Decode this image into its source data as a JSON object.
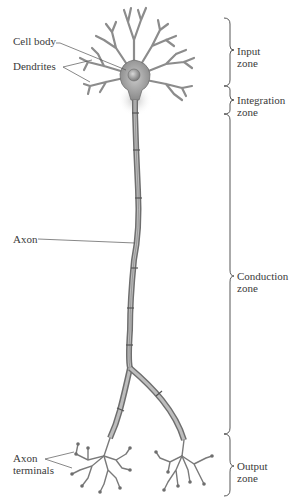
{
  "diagram": {
    "structure_labels": {
      "cell_body": "Cell body",
      "dendrites": "Dendrites",
      "axon": "Axon",
      "axon_terminals_line1": "Axon",
      "axon_terminals_line2": "terminals"
    },
    "zones": [
      {
        "line1": "Input",
        "line2": "zone"
      },
      {
        "line1": "Integration",
        "line2": "zone"
      },
      {
        "line1": "Conduction",
        "line2": "zone"
      },
      {
        "line1": "Output",
        "line2": "zone"
      }
    ],
    "colors": {
      "neuron_fill": "#9a9a9a",
      "neuron_stroke": "#6e6e6e",
      "axon_hillock_glow": "#c8c8c8",
      "label_text": "#3a3a3a",
      "leader_line": "#555555",
      "background": "#ffffff"
    }
  }
}
